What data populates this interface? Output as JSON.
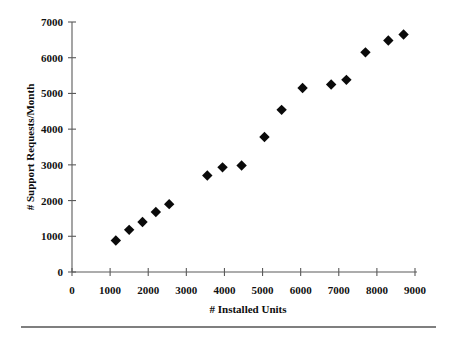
{
  "chart_data": {
    "type": "scatter",
    "title": "",
    "xlabel": "# Installed Units",
    "ylabel": "# Support Requests/Month",
    "xlim": [
      0,
      9000
    ],
    "ylim": [
      0,
      7000
    ],
    "xticks": [
      0,
      1000,
      2000,
      3000,
      4000,
      5000,
      6000,
      7000,
      8000,
      9000
    ],
    "yticks": [
      0,
      1000,
      2000,
      3000,
      4000,
      5000,
      6000,
      7000
    ],
    "xtick_labels": [
      "0",
      "1000",
      "2000",
      "3000",
      "4000",
      "5000",
      "6000",
      "7000",
      "8000",
      "9000"
    ],
    "ytick_labels": [
      "0",
      "1000",
      "2000",
      "3000",
      "4000",
      "5000",
      "6000",
      "7000"
    ],
    "grid": false,
    "legend": null,
    "marker": "diamond",
    "marker_color": "#0a0a0a",
    "x": [
      1150,
      1500,
      1850,
      2200,
      2550,
      3550,
      3950,
      4450,
      5050,
      5500,
      6050,
      6800,
      7200,
      7700,
      8300,
      8700
    ],
    "y": [
      880,
      1180,
      1400,
      1680,
      1900,
      2700,
      2930,
      2980,
      3780,
      4540,
      5150,
      5250,
      5380,
      6150,
      6480,
      6650
    ],
    "points": [
      {
        "x": 1150,
        "y": 880
      },
      {
        "x": 1500,
        "y": 1180
      },
      {
        "x": 1850,
        "y": 1400
      },
      {
        "x": 2200,
        "y": 1680
      },
      {
        "x": 2550,
        "y": 1900
      },
      {
        "x": 3550,
        "y": 2700
      },
      {
        "x": 3950,
        "y": 2930
      },
      {
        "x": 4450,
        "y": 2980
      },
      {
        "x": 5050,
        "y": 3780
      },
      {
        "x": 5500,
        "y": 4540
      },
      {
        "x": 6050,
        "y": 5150
      },
      {
        "x": 6800,
        "y": 5250
      },
      {
        "x": 7200,
        "y": 5380
      },
      {
        "x": 7700,
        "y": 6150
      },
      {
        "x": 8300,
        "y": 6480
      },
      {
        "x": 8700,
        "y": 6650
      }
    ]
  },
  "figure": {
    "background_color": "#ffffff",
    "axis_color": "#5a5a5a",
    "text_color": "#0d0d0d",
    "footer_rule_color": "#555555"
  }
}
